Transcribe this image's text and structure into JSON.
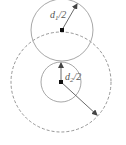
{
  "diagram": {
    "labels": {
      "d1": {
        "var": "d",
        "sub": "1",
        "suffix": "/2"
      },
      "d2": {
        "var": "d",
        "sub": "2",
        "suffix": "/2"
      }
    },
    "colors": {
      "circle_stroke": "#a8a8a8",
      "dashed_stroke": "#8a8a8a",
      "arrow": "#444444",
      "center_dot": "#111111",
      "background": "#ffffff"
    },
    "shapes": {
      "upper_circle": {
        "cx": 62,
        "cy": 30,
        "r": 31,
        "style": "solid"
      },
      "outer_dashed_circle": {
        "cx": 61,
        "cy": 82,
        "r": 50,
        "style": "dashed"
      },
      "inner_circle": {
        "cx": 61,
        "cy": 82,
        "r": 20,
        "style": "solid"
      }
    }
  }
}
